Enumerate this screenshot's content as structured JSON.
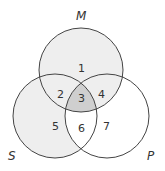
{
  "diagram": {
    "type": "venn",
    "sets": [
      {
        "name": "M",
        "label": "M"
      },
      {
        "name": "S",
        "label": "S"
      },
      {
        "name": "P",
        "label": "P"
      }
    ],
    "regions": [
      {
        "id": "1",
        "label": "1",
        "shaded": "light"
      },
      {
        "id": "2",
        "label": "2",
        "shaded": "light"
      },
      {
        "id": "3",
        "label": "3",
        "shaded": "dark"
      },
      {
        "id": "4",
        "label": "4",
        "shaded": "light"
      },
      {
        "id": "5",
        "label": "5",
        "shaded": "light"
      },
      {
        "id": "6",
        "label": "6",
        "shaded": "none"
      },
      {
        "id": "7",
        "label": "7",
        "shaded": "none"
      }
    ],
    "colors": {
      "light": "#eeeeee",
      "dark": "#cfcfcf",
      "stroke": "#444444"
    }
  }
}
